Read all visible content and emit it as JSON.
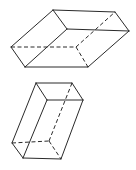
{
  "figure": {
    "stroke_color": "#2a2a2a",
    "background": "#ffffff",
    "shapes": [
      {
        "name": "flat-box",
        "visible_edges": [
          [
            [
              53,
              10
            ],
            [
              115,
              12
            ]
          ],
          [
            [
              115,
              12
            ],
            [
              129,
              31
            ]
          ],
          [
            [
              129,
              31
            ],
            [
              67,
              29
            ]
          ],
          [
            [
              67,
              29
            ],
            [
              53,
              10
            ]
          ],
          [
            [
              53,
              10
            ],
            [
              11,
              47
            ]
          ],
          [
            [
              67,
              29
            ],
            [
              25,
              67
            ]
          ],
          [
            [
              129,
              31
            ],
            [
              88,
              67
            ]
          ],
          [
            [
              11,
              47
            ],
            [
              25,
              67
            ]
          ],
          [
            [
              25,
              67
            ],
            [
              88,
              67
            ]
          ]
        ],
        "hidden_edges": [
          [
            [
              11,
              47
            ],
            [
              76,
              47
            ]
          ],
          [
            [
              76,
              47
            ],
            [
              88,
              67
            ]
          ],
          [
            [
              76,
              47
            ],
            [
              115,
              12
            ]
          ]
        ]
      },
      {
        "name": "upright-box",
        "visible_edges": [
          [
            [
              36,
              83
            ],
            [
              72,
              83
            ]
          ],
          [
            [
              72,
              83
            ],
            [
              83,
              100
            ]
          ],
          [
            [
              83,
              100
            ],
            [
              47,
              100
            ]
          ],
          [
            [
              47,
              100
            ],
            [
              36,
              83
            ]
          ],
          [
            [
              36,
              83
            ],
            [
              12,
              143
            ]
          ],
          [
            [
              47,
              100
            ],
            [
              23,
              158
            ]
          ],
          [
            [
              83,
              100
            ],
            [
              61,
              159
            ]
          ],
          [
            [
              12,
              143
            ],
            [
              23,
              158
            ]
          ],
          [
            [
              23,
              158
            ],
            [
              61,
              159
            ]
          ]
        ],
        "hidden_edges": [
          [
            [
              12,
              143
            ],
            [
              49,
              141
            ]
          ],
          [
            [
              49,
              141
            ],
            [
              61,
              159
            ]
          ],
          [
            [
              49,
              141
            ],
            [
              72,
              83
            ]
          ]
        ]
      }
    ]
  }
}
